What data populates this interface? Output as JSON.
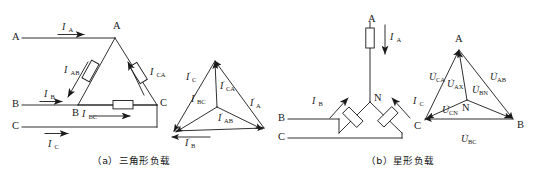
{
  "figure": {
    "caption_a": "（a）三角形负载",
    "caption_b": "（b）星形负载",
    "stroke_color": "#1a1a1a",
    "background": "#ffffff"
  },
  "diagram_a": {
    "name": "delta-connected-load",
    "supply_terminals": [
      "A",
      "B",
      "C"
    ],
    "node_labels": [
      "A",
      "B",
      "C"
    ],
    "line_currents": [
      "I",
      "I",
      "I"
    ],
    "line_current_labels": [
      {
        "symbol": "I",
        "sub": "A"
      },
      {
        "symbol": "I",
        "sub": "B"
      },
      {
        "symbol": "I",
        "sub": "C"
      }
    ],
    "phase_current_labels": [
      {
        "symbol": "I",
        "sub": "AB"
      },
      {
        "symbol": "I",
        "sub": "BC"
      },
      {
        "symbol": "I",
        "sub": "CA"
      }
    ],
    "load_count": 3
  },
  "phasor_a": {
    "name": "delta-phasor-diagram",
    "type": "phasor",
    "vertices": {
      "top": "A",
      "bottom_left": "B",
      "bottom_right": "C"
    },
    "labels": [
      {
        "symbol": "I",
        "sub": "C",
        "dot": true
      },
      {
        "symbol": "I",
        "sub": "CA",
        "dot": true
      },
      {
        "symbol": "I",
        "sub": "BC",
        "dot": true
      },
      {
        "symbol": "I",
        "sub": "A",
        "dot": true
      },
      {
        "symbol": "I",
        "sub": "AB",
        "dot": true
      },
      {
        "symbol": "I",
        "sub": "B",
        "dot": true
      }
    ]
  },
  "diagram_b": {
    "name": "star-connected-load",
    "supply_terminals": [
      "A",
      "B",
      "C"
    ],
    "neutral_label": "N",
    "line_current_labels": [
      {
        "symbol": "I",
        "sub": "A"
      },
      {
        "symbol": "I",
        "sub": "B"
      },
      {
        "symbol": "I",
        "sub": "C"
      }
    ],
    "load_count": 3
  },
  "phasor_b": {
    "name": "star-phasor-diagram",
    "type": "phasor",
    "vertices": {
      "top": "A",
      "bottom_left": "C",
      "bottom_right": "B",
      "center": "N"
    },
    "labels": [
      {
        "symbol": "U",
        "sub": "CA",
        "dot": true
      },
      {
        "symbol": "U",
        "sub": "AB",
        "dot": true
      },
      {
        "symbol": "U",
        "sub": "BC",
        "dot": true
      },
      {
        "symbol": "U",
        "sub": "AX",
        "dot": true
      },
      {
        "symbol": "U",
        "sub": "BN",
        "dot": true
      },
      {
        "symbol": "U",
        "sub": "CN",
        "dot": true
      }
    ]
  }
}
